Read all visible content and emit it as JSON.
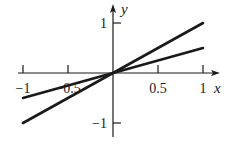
{
  "chart_data": {
    "type": "line",
    "title": "",
    "xlabel": "x",
    "ylabel": "y",
    "xlim": [
      -1,
      1
    ],
    "ylim": [
      -1,
      1
    ],
    "grid": false,
    "legend": null,
    "x_ticks": [
      -1,
      -0.5,
      0.5,
      1
    ],
    "x_tick_labels": [
      "−1",
      "−0.5",
      "0.5",
      "1"
    ],
    "y_ticks": [
      1,
      -1
    ],
    "y_tick_labels": [
      "1",
      "−1"
    ],
    "series": [
      {
        "name": "y = x",
        "x": [
          -1,
          1
        ],
        "y": [
          -1,
          1
        ]
      },
      {
        "name": "y = 0.5x",
        "x": [
          -1,
          1
        ],
        "y": [
          -0.5,
          0.5
        ]
      }
    ]
  },
  "colors": {
    "ink": "#1a1a1a",
    "background": "#ffffff"
  }
}
